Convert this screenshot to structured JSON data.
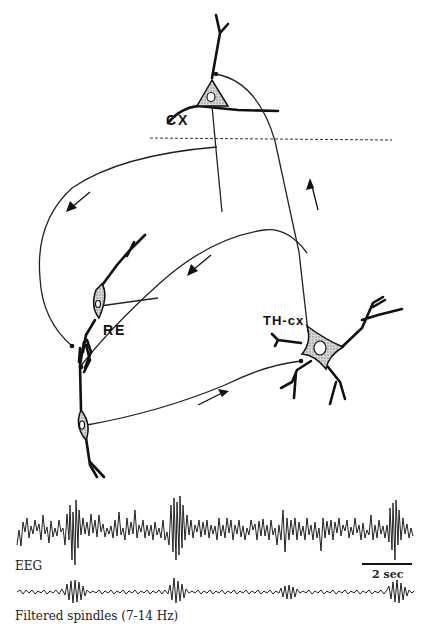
{
  "labels": {
    "cortex": "CX",
    "reticular": "RE",
    "thalamocortical": "TH-cx",
    "eeg": "EEG",
    "scale_bar": "2 sec",
    "filtered": "Filtered spindles (7-14 Hz)"
  },
  "cells": [
    {
      "id": "cx",
      "type": "pyramidal",
      "label": "CX"
    },
    {
      "id": "re-upper",
      "type": "bipolar",
      "label": "RE"
    },
    {
      "id": "re-lower",
      "type": "bipolar",
      "label": ""
    },
    {
      "id": "th-cx",
      "type": "multipolar",
      "label": "TH-cx"
    }
  ],
  "arrows": [
    {
      "from": "cx",
      "to": "re",
      "direction": "down-left"
    },
    {
      "from": "th-cx",
      "to": "cx",
      "direction": "up"
    },
    {
      "from": "th-cx",
      "to": "re",
      "direction": "down-left"
    },
    {
      "from": "re",
      "to": "th-cx",
      "direction": "right"
    }
  ],
  "traces": {
    "eeg": {
      "label": "EEG",
      "spindle_bursts_x": [
        75,
        180,
        400
      ]
    },
    "filtered": {
      "label": "Filtered spindles (7-14 Hz)",
      "band_hz": [
        7,
        14
      ],
      "spindle_bursts_x": [
        75,
        180,
        290,
        400
      ]
    },
    "scale_bar": {
      "label": "2 sec",
      "x1": 362,
      "x2": 412
    }
  },
  "colors": {
    "ink": "#111111",
    "background": "#ffffff",
    "soma_fill": "#bbbbbb"
  }
}
